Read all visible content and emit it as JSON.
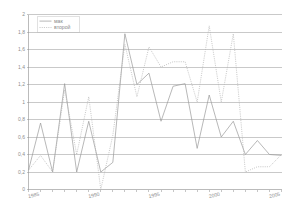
{
  "chart_data": {
    "type": "line",
    "title": "",
    "xlabel": "",
    "ylabel": "",
    "ylim": [
      0,
      2
    ],
    "xlim": [
      1985,
      2006
    ],
    "ytick_step": 0.2,
    "grid": true,
    "decimal_separator": ",",
    "legend_position": "top-left",
    "ytick_labels": [
      "0",
      "0,2",
      "0,4",
      "0,6",
      "0,8",
      "1",
      "1,2",
      "1,4",
      "1,6",
      "1,8",
      "2"
    ],
    "ytick_values": [
      0,
      0.2,
      0.4,
      0.6,
      0.8,
      1,
      1.2,
      1.4,
      1.6,
      1.8,
      2
    ],
    "xtick_labels": [
      "1985",
      "1990",
      "1995",
      "2000",
      "2005"
    ],
    "xtick_values": [
      1985,
      1990,
      1995,
      2000,
      2005
    ],
    "x": [
      1985,
      1986,
      1987,
      1988,
      1989,
      1990,
      1991,
      1992,
      1993,
      1994,
      1995,
      1996,
      1997,
      1998,
      1999,
      2000,
      2001,
      2002,
      2003,
      2004,
      2005,
      2006
    ],
    "series": [
      {
        "name": "мак",
        "style": "solid",
        "color": "#9a9a9a",
        "values": [
          0.22,
          0.76,
          0.2,
          1.21,
          0.2,
          0.78,
          0.2,
          0.31,
          1.78,
          1.2,
          1.33,
          0.78,
          1.18,
          1.21,
          0.47,
          1.08,
          0.6,
          0.78,
          0.4,
          0.56,
          0.4,
          0.39
        ]
      },
      {
        "name": "второй",
        "style": "dotted",
        "color": "#b4b4b4",
        "values": [
          0.22,
          0.39,
          0.2,
          1.14,
          0.4,
          1.06,
          0.0,
          0.62,
          1.66,
          1.06,
          1.63,
          1.4,
          1.46,
          1.46,
          1.0,
          1.87,
          1.0,
          1.78,
          0.2,
          0.26,
          0.26,
          0.4
        ]
      }
    ]
  },
  "legend": {
    "entries": [
      {
        "label": "мак",
        "style": "solid"
      },
      {
        "label": "второй",
        "style": "dotted"
      }
    ]
  }
}
